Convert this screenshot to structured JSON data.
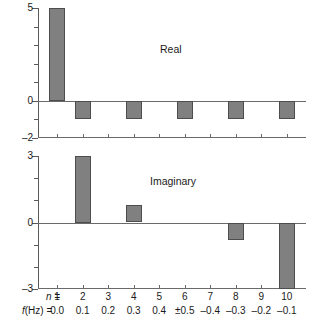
{
  "chart_data": [
    {
      "type": "bar",
      "title": "Real",
      "xlabel": "",
      "ylabel": "",
      "ylim": [
        -2,
        5
      ],
      "ytick_labels": [
        "5",
        "0",
        "–2"
      ],
      "ytick_values": [
        5,
        0,
        -2
      ],
      "yminor_ticks": [
        5,
        4,
        3,
        2,
        1,
        0,
        -1,
        -2
      ],
      "grid": false,
      "legend": "none",
      "categories": [
        "1",
        "2",
        "3",
        "4",
        "5",
        "6",
        "7",
        "8",
        "9",
        "10"
      ],
      "values": [
        5,
        -1,
        0,
        -1,
        0,
        -1,
        0,
        -1,
        0,
        -1
      ]
    },
    {
      "type": "bar",
      "title": "Imaginary",
      "xlabel": "",
      "ylabel": "",
      "ylim": [
        -3,
        3
      ],
      "ytick_labels": [
        "3",
        "0",
        "–3"
      ],
      "ytick_values": [
        3,
        0,
        -3
      ],
      "yminor_ticks": [
        3,
        2,
        1,
        0,
        -1,
        -2,
        -3
      ],
      "grid": false,
      "legend": "none",
      "categories": [
        "1",
        "2",
        "3",
        "4",
        "5",
        "6",
        "7",
        "8",
        "9",
        "10"
      ],
      "values": [
        0,
        3,
        0,
        0.8,
        0,
        0,
        0,
        -0.8,
        0,
        -3
      ]
    }
  ],
  "axis_table": {
    "n_row_label": "n =",
    "f_row_label_f": "f",
    "f_row_label_hz": "(Hz) =",
    "n_values": [
      "1",
      "2",
      "3",
      "4",
      "5",
      "6",
      "7",
      "8",
      "9",
      "10"
    ],
    "f_values": [
      "0.0",
      "0.1",
      "0.2",
      "0.3",
      "0.4",
      "±0.5",
      "–0.4",
      "–0.3",
      "–0.2",
      "–0.1"
    ]
  },
  "style": {
    "bar_fill": "#808080",
    "bar_edge": "#4d4d4d",
    "axis_color": "#5a5a5a",
    "text_color": "#1a1a1a",
    "background": "#ffffff"
  }
}
